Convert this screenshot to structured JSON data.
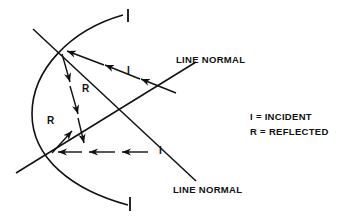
{
  "diagram": {
    "stroke_color": "#111111",
    "background_color": "#ffffff",
    "labels": {
      "line_normal_top": "LINE NORMAL",
      "line_normal_bottom": "LINE NORMAL",
      "incident_top": "I",
      "incident_bottom": "I",
      "reflected_upper": "R",
      "reflected_lower": "R"
    },
    "legend": {
      "incident": "I = INCIDENT",
      "reflected": "R = REFLECTED"
    },
    "mirror": {
      "name": "concave-mirror-arc",
      "description": "Curved mirror surface drawn as an arc bulging to the left, terminated at both ends by short perpendicular tick marks",
      "top_tick": "arc-end-tick-top",
      "bottom_tick": "arc-end-tick-bottom"
    },
    "rays": [
      {
        "name": "incident-ray-upper",
        "symbol": "I",
        "direction": "travels up-left from the lower right toward the upper reflection point",
        "arrowheads": 3
      },
      {
        "name": "reflected-ray-upper",
        "symbol": "R",
        "direction": "travels down and slightly right from the upper reflection point",
        "arrowheads": 3
      },
      {
        "name": "incident-ray-lower",
        "symbol": "I",
        "direction": "travels horizontally leftward toward the lower reflection point",
        "arrowheads": 3
      },
      {
        "name": "reflected-ray-lower",
        "symbol": "R",
        "direction": "travels up and to the right from the lower reflection point",
        "arrowheads": 1
      }
    ],
    "normal_lines": [
      {
        "name": "normal-line-upper",
        "description": "straight line through the upper reflection point, running from upper left to lower right"
      },
      {
        "name": "normal-line-lower",
        "description": "straight line through the lower reflection point, running from lower left to upper right"
      }
    ]
  }
}
